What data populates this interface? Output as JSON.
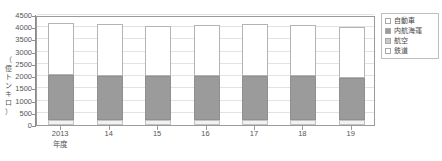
{
  "chart_data": {
    "type": "bar",
    "stacked": true,
    "title": "",
    "xlabel": "年度",
    "ylabel": "（億トンキロ）",
    "categories": [
      "2013",
      "14",
      "15",
      "16",
      "17",
      "18",
      "19"
    ],
    "ylim": [
      0,
      4500
    ],
    "yticks": [
      0,
      500,
      1000,
      1500,
      2000,
      2500,
      3000,
      3500,
      4000,
      4500
    ],
    "grid": true,
    "legend_position": "top-right",
    "series": [
      {
        "name": "鉄道",
        "color": "#f2f2f2",
        "values": [
          187,
          186,
          186,
          189,
          195,
          194,
          196
        ]
      },
      {
        "name": "航空",
        "color": "#c9c9c9",
        "values": [
          11,
          11,
          11,
          11,
          11,
          11,
          10
        ]
      },
      {
        "name": "内航海運",
        "color": "#9b9b9b",
        "values": [
          1849,
          1826,
          1802,
          1800,
          1809,
          1798,
          1698
        ]
      },
      {
        "name": "自動車",
        "color": "#ffffff",
        "values": [
          2143,
          2122,
          2041,
          2104,
          2108,
          2103,
          2090
        ]
      }
    ],
    "totals": [
      4190,
      4145,
      4040,
      4104,
      4123,
      4106,
      3994
    ]
  },
  "axis": {
    "y_unit_chars": [
      "（",
      "億",
      "ト",
      "ン",
      "キ",
      "ロ",
      "）"
    ],
    "x_unit": "年度"
  },
  "legend": {
    "items": [
      {
        "label": "自動車",
        "swatch": "auto"
      },
      {
        "label": "内航海運",
        "swatch": "kaiun"
      },
      {
        "label": "航空",
        "swatch": "koku"
      },
      {
        "label": "鉄道",
        "swatch": "tetsu"
      }
    ]
  }
}
